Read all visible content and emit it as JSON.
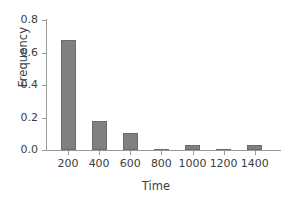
{
  "chart_data": {
    "type": "bar",
    "title": "",
    "xlabel": "Time",
    "ylabel": "Frequency",
    "categories": [
      "200",
      "400",
      "600",
      "800",
      "1000",
      "1200",
      "1400"
    ],
    "values": [
      0.68,
      0.18,
      0.105,
      0.005,
      0.03,
      0.005,
      0.03
    ],
    "xtick_labels": [
      "200",
      "400",
      "600",
      "800",
      "1000",
      "1200",
      "1400"
    ],
    "ytick_labels": [
      "0.0",
      "0.2",
      "0.4",
      "0.6",
      "0.8"
    ],
    "ytick_values": [
      0.0,
      0.2,
      0.4,
      0.6,
      0.8
    ],
    "ylim": [
      0.0,
      0.8
    ],
    "xlim": [
      100,
      1500
    ],
    "grid": false,
    "legend": false,
    "bar_color": "#808080",
    "bar_edge_color": "#6b6b6b",
    "axis_color": "#9a9a9a",
    "text_color": "#404040",
    "background_color": "#ffffff"
  }
}
